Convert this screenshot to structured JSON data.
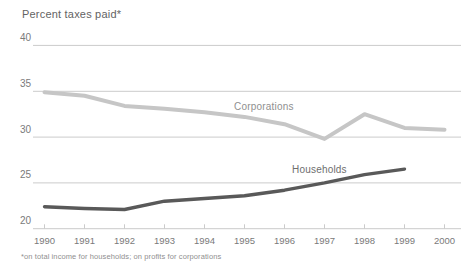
{
  "chart": {
    "title": "Percent taxes paid*",
    "footnote": "*on total income for households; on profits for corporations"
  },
  "chart_data": {
    "type": "line",
    "title": "Percent taxes paid*",
    "xlabel": "",
    "ylabel": "Percent taxes paid",
    "x": [
      1990,
      1991,
      1992,
      1993,
      1994,
      1995,
      1996,
      1997,
      1998,
      1999,
      2000
    ],
    "yticks": [
      40,
      35,
      30,
      25,
      20
    ],
    "ylim": [
      20,
      40
    ],
    "grid": "horizontal",
    "legend_position": "inline-labels",
    "series": [
      {
        "name": "Corporations",
        "color": "#c6c6c6",
        "values": [
          34.9,
          34.5,
          33.4,
          33.1,
          32.7,
          32.2,
          31.4,
          29.8,
          32.5,
          31.0,
          30.8
        ]
      },
      {
        "name": "Households",
        "color": "#595959",
        "values": [
          22.4,
          22.2,
          22.1,
          23.0,
          23.3,
          23.6,
          24.2,
          25.0,
          25.9,
          26.5,
          null
        ]
      }
    ],
    "footnote": "*on total income for households; on profits for corporations"
  },
  "colors": {
    "background": "#ffffff",
    "gridline": "#cbcbcb",
    "axis_text": "#7a7a7a",
    "title_text": "#636363",
    "footnote_text": "#8f8f8f"
  }
}
